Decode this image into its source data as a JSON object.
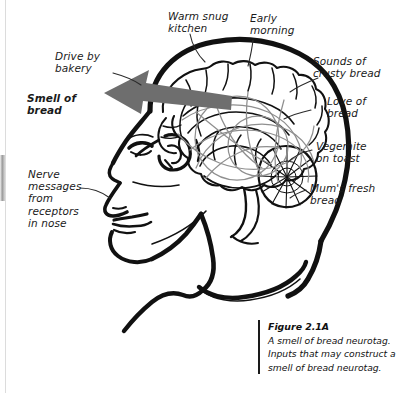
{
  "figure": {
    "domain": "diagram",
    "title_visible": false,
    "background_color": "#ffffff",
    "ink_color": "#111111",
    "arrow_color": "#6e6e6e",
    "network_color": "#8a8a8a"
  },
  "labels": {
    "warm_snug_kitchen": "Warm snug\nkitchen",
    "early_morning": "Early\nmorning",
    "sounds_of_crusty_bread": "Sounds of\ncrusty bread",
    "love_of_bread": "Love of\nbread",
    "vegemite_on_toast": "Vegemite\non toast",
    "mums_fresh_bread": "Mum's fresh\nbread",
    "drive_by_bakery": "Drive by\nbakery",
    "smell_of_bread": "Smell of\nbread",
    "nerve_messages": "Nerve\nmessages\nfrom\nreceptors\nin nose"
  },
  "caption": {
    "number": "Figure 2.1A",
    "text": "A smell of bread neurotag. Inputs that may construct a smell of bread neurotag."
  },
  "icons": {
    "arrow": "left-arrow-icon",
    "brain": "brain-icon",
    "head": "head-profile-icon",
    "cerebellum": "cerebellum-icon"
  }
}
